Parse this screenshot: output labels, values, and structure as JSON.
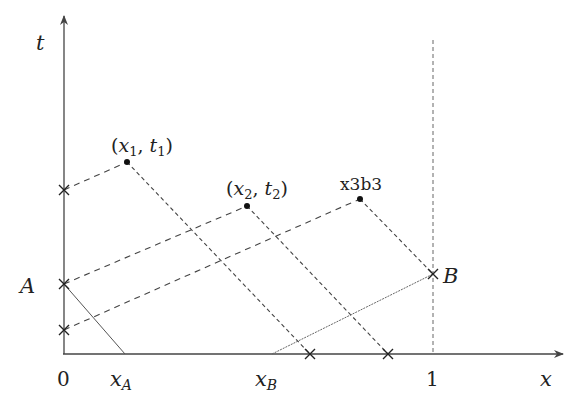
{
  "axes": {
    "x_label": "x",
    "t_label": "t",
    "origin_label": "0",
    "one_label": "1"
  },
  "points": {
    "p1": {
      "label_open": "(",
      "x": "x",
      "x_sub": "1",
      "sep": ", ",
      "t": "t",
      "t_sub": "1",
      "label_close": ")"
    },
    "p2": {
      "label_open": "(",
      "x": "x",
      "x_sub": "2",
      "sep": ", ",
      "t": "t",
      "t_sub": "2",
      "label_close": ")"
    },
    "p3": {
      "label": "x3b3"
    }
  },
  "markers": {
    "A": "A",
    "B": "B",
    "xA_main": "x",
    "xA_sub": "A",
    "xB_main": "x",
    "xB_sub": "B"
  },
  "colors": {
    "axis": "#444444",
    "dashed": "#444444",
    "solid_thin": "#555555",
    "text": "#222222"
  }
}
